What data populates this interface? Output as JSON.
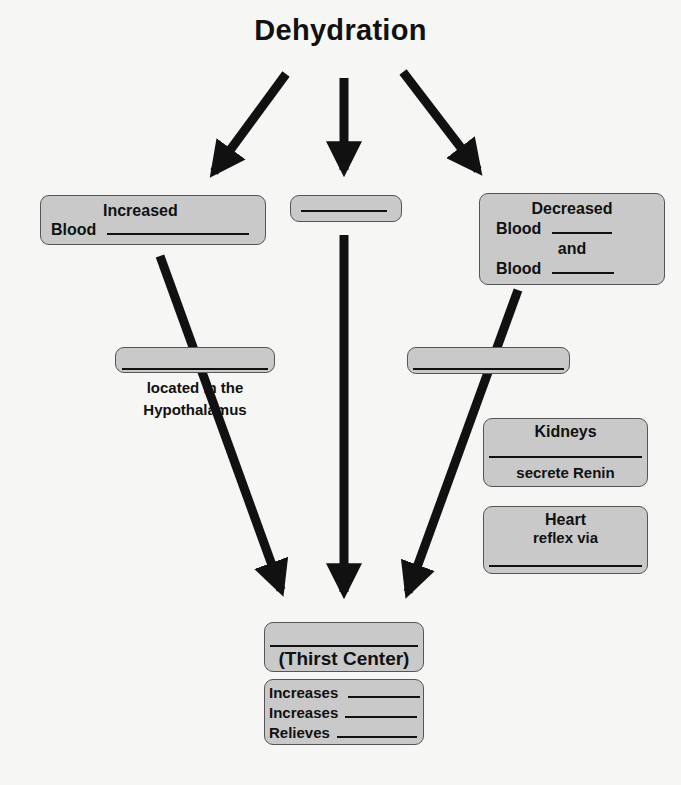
{
  "title": "Dehydration",
  "boxes": {
    "left": {
      "line1": "Increased",
      "line2": "Blood"
    },
    "center": {},
    "right": {
      "line1": "Decreased",
      "line2": "Blood",
      "line3": "and",
      "line4": "Blood"
    },
    "osmo": {
      "caption1": "located in the",
      "caption2": "Hypothalamus"
    },
    "baro": {},
    "kidneys": {
      "title": "Kidneys",
      "text": "secrete Renin"
    },
    "heart": {
      "title": "Heart",
      "text": "reflex via"
    },
    "thirst": {
      "label": "(Thirst Center)"
    },
    "effects": {
      "items": [
        "Increases",
        "Increases",
        "Relieves"
      ]
    }
  },
  "colors": {
    "box_fill": "#c9c9c9",
    "arrow": "#111111",
    "background": "#f6f6f4"
  }
}
